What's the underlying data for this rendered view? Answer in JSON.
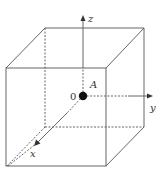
{
  "diagram": {
    "type": "cube-with-axes",
    "labels": {
      "z_axis": "z",
      "y_axis": "y",
      "x_axis": "x",
      "origin": "0",
      "point": "A"
    },
    "colors": {
      "line": "#555555",
      "point": "#111111",
      "background": "#ffffff"
    }
  }
}
